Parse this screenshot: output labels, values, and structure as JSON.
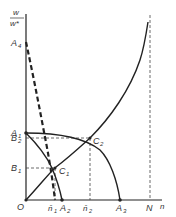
{
  "diagram": {
    "type": "function-curves",
    "axes": {
      "y_label_numerator": "w",
      "y_label_denominator": "w*",
      "x_label": "n",
      "origin_label": "O"
    },
    "y_axis_labels": {
      "A4": {
        "main": "A",
        "sub": "4"
      },
      "A1": {
        "main": "A",
        "sub": "1"
      },
      "B2": {
        "main": "B",
        "sub": "2"
      },
      "B1": {
        "main": "B",
        "sub": "1"
      }
    },
    "x_axis_labels": {
      "n1": {
        "main": "n̄",
        "sub": "1"
      },
      "A2": {
        "main": "A",
        "sub": "2"
      },
      "n2": {
        "main": "n̄",
        "sub": "2"
      },
      "A3": {
        "main": "A",
        "sub": "3"
      },
      "N": {
        "main": "N",
        "sub": ""
      }
    },
    "points": {
      "C1": {
        "main": "C",
        "sub": "1"
      },
      "C2": {
        "main": "C",
        "sub": "2"
      }
    },
    "curves": [
      {
        "name": "rising-curve",
        "from": "O",
        "to": "near N asymptote",
        "style": "solid"
      },
      {
        "name": "A1-A2-curve",
        "from": "A1",
        "to": "A2",
        "style": "solid"
      },
      {
        "name": "A1-A3-curve",
        "from": "A1",
        "to": "A3",
        "style": "solid"
      },
      {
        "name": "A4-dashed-curve",
        "from": "A4",
        "to": "A2",
        "style": "thick-dashed"
      },
      {
        "name": "N-asymptote",
        "at": "N",
        "style": "dashed-vertical"
      }
    ],
    "intersections": [
      {
        "point": "C1",
        "projects_to": [
          "B1",
          "n̄1"
        ]
      },
      {
        "point": "C2",
        "projects_to": [
          "B2",
          "n̄2"
        ]
      }
    ]
  }
}
